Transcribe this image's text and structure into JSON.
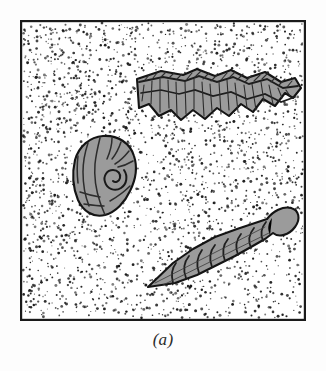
{
  "figure": {
    "caption": "(a)",
    "panel_label": "a",
    "frame": {
      "x": 20,
      "y": 20,
      "width": 286,
      "height": 301,
      "border_color": "#1a1a1a",
      "border_width": 2,
      "fill_color": "#ffffff"
    },
    "background_color": "#fdfdfd",
    "matrix": {
      "name": "stipple-sediment-texture",
      "description": "Random fine black stipple dots representing sedimentary rock matrix",
      "dot_color": "#1b1b1b",
      "dot_count": 2600,
      "dot_radius_min": 0.5,
      "dot_radius_max": 1.5,
      "density_note": "slightly denser toward upper-left, sparser at lower-right"
    },
    "specimens": [
      {
        "id": "specimen-brachiopod",
        "label": "ribbed bivalve shell",
        "position_note": "upper right of panel, oriented on a shallow downward diagonal",
        "fill_color": "#9b9b9b",
        "outline_color": "#141414",
        "rib_color": "#2c2c2c",
        "rib_count": 24,
        "bounding_box": {
          "x": 135,
          "y": 66,
          "width": 140,
          "height": 68
        }
      },
      {
        "id": "specimen-gastropod-coiled",
        "label": "coiled gastropod shell",
        "position_note": "left-of-center of panel",
        "fill_color": "#9b9b9b",
        "outline_color": "#141414",
        "rib_color": "#2c2c2c",
        "rib_count": 9,
        "bounding_box": {
          "x": 72,
          "y": 134,
          "width": 60,
          "height": 72
        }
      },
      {
        "id": "specimen-turritella",
        "label": "high-spired screw-shaped gastropod",
        "position_note": "lower right of panel, oriented on a diagonal rising to the right",
        "fill_color": "#9b9b9b",
        "outline_color": "#141414",
        "rib_color": "#2c2c2c",
        "whorl_count": 9,
        "bounding_box": {
          "x": 145,
          "y": 205,
          "width": 135,
          "height": 82
        }
      }
    ]
  }
}
